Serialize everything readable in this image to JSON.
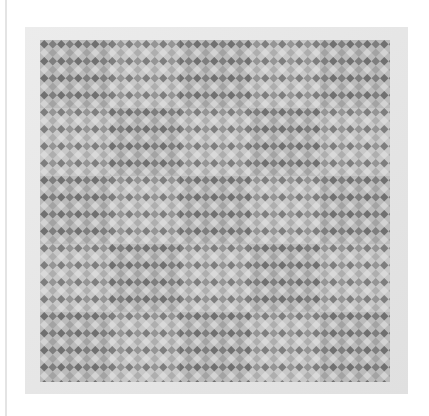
{
  "image": {
    "alt": "Grayscale photograph of a quilt with a diamond checkerboard pattern arranged in a 5 by 5 grid of blocks",
    "subject": "quilt",
    "pattern": "diamond-checker",
    "blocks": {
      "rows": 5,
      "cols": 5
    },
    "colors": {
      "background": "#ffffff",
      "border": "#e6e6e6",
      "dark_diamond": "#6e6e6e",
      "mid_diamond": "#9a9a9a",
      "light_diamond": "#d0d0d0",
      "field": "#bdbdbd"
    }
  }
}
